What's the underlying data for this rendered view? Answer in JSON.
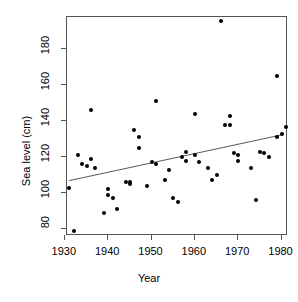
{
  "chart_data": {
    "type": "scatter",
    "title": "",
    "xlabel": "Year",
    "ylabel": "Sea level (cm)",
    "xlim": [
      1930.5,
      1981.5
    ],
    "ylim": [
      76,
      198
    ],
    "xticks": [
      1930,
      1940,
      1950,
      1960,
      1970,
      1980
    ],
    "yticks": [
      80,
      100,
      120,
      140,
      160,
      180
    ],
    "xticklabels": [
      "1930",
      "1940",
      "1950",
      "1960",
      "1970",
      "1980"
    ],
    "yticklabels": [
      "80",
      "100",
      "120",
      "140",
      "160",
      "180"
    ],
    "grid": false,
    "legend": null,
    "marker": "filled-circle",
    "marker_color": "#000000",
    "points": [
      {
        "x": 1931,
        "y": 103
      },
      {
        "x": 1932,
        "y": 79
      },
      {
        "x": 1933,
        "y": 121
      },
      {
        "x": 1934,
        "y": 116
      },
      {
        "x": 1935,
        "y": 115
      },
      {
        "x": 1936,
        "y": 146
      },
      {
        "x": 1936,
        "y": 119
      },
      {
        "x": 1937,
        "y": 114
      },
      {
        "x": 1939,
        "y": 89
      },
      {
        "x": 1940,
        "y": 102
      },
      {
        "x": 1940,
        "y": 99
      },
      {
        "x": 1941,
        "y": 97
      },
      {
        "x": 1942,
        "y": 91
      },
      {
        "x": 1944,
        "y": 106
      },
      {
        "x": 1945,
        "y": 106
      },
      {
        "x": 1945,
        "y": 105
      },
      {
        "x": 1946,
        "y": 135
      },
      {
        "x": 1947,
        "y": 131
      },
      {
        "x": 1947,
        "y": 125
      },
      {
        "x": 1949,
        "y": 104
      },
      {
        "x": 1950,
        "y": 117
      },
      {
        "x": 1951,
        "y": 151
      },
      {
        "x": 1951,
        "y": 116
      },
      {
        "x": 1953,
        "y": 107
      },
      {
        "x": 1954,
        "y": 113
      },
      {
        "x": 1955,
        "y": 97
      },
      {
        "x": 1956,
        "y": 95
      },
      {
        "x": 1957,
        "y": 120
      },
      {
        "x": 1958,
        "y": 123
      },
      {
        "x": 1958,
        "y": 118
      },
      {
        "x": 1960,
        "y": 144
      },
      {
        "x": 1960,
        "y": 121
      },
      {
        "x": 1961,
        "y": 117
      },
      {
        "x": 1963,
        "y": 114
      },
      {
        "x": 1964,
        "y": 107
      },
      {
        "x": 1965,
        "y": 110
      },
      {
        "x": 1966,
        "y": 196
      },
      {
        "x": 1967,
        "y": 138
      },
      {
        "x": 1968,
        "y": 143
      },
      {
        "x": 1968,
        "y": 138
      },
      {
        "x": 1969,
        "y": 122
      },
      {
        "x": 1970,
        "y": 121
      },
      {
        "x": 1970,
        "y": 118
      },
      {
        "x": 1973,
        "y": 114
      },
      {
        "x": 1974,
        "y": 96
      },
      {
        "x": 1975,
        "y": 123
      },
      {
        "x": 1976,
        "y": 122
      },
      {
        "x": 1977,
        "y": 120
      },
      {
        "x": 1979,
        "y": 165
      },
      {
        "x": 1979,
        "y": 131
      },
      {
        "x": 1980,
        "y": 133
      },
      {
        "x": 1981,
        "y": 137
      }
    ],
    "trend_line": {
      "type": "linear-fit",
      "x_start": 1931,
      "y_start": 106,
      "x_end": 1981,
      "y_end": 132,
      "color": "#555555"
    }
  }
}
